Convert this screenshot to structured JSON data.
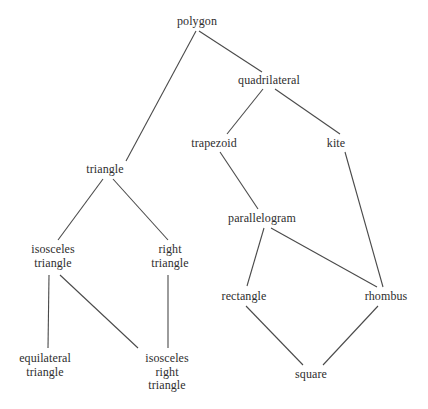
{
  "diagram": {
    "background_color": "#ffffff",
    "text_color": "#2e2e2e",
    "edge_color": "#4a4a4a",
    "nodes": [
      {
        "id": "polygon",
        "label": "polygon",
        "x": 197,
        "y": 22,
        "lines": 1
      },
      {
        "id": "quadrilateral",
        "label": "quadrilateral",
        "x": 269,
        "y": 81,
        "lines": 1
      },
      {
        "id": "trapezoid",
        "label": "trapezoid",
        "x": 214,
        "y": 144,
        "lines": 1
      },
      {
        "id": "kite",
        "label": "kite",
        "x": 336,
        "y": 144,
        "lines": 1
      },
      {
        "id": "triangle",
        "label": "triangle",
        "x": 105,
        "y": 170,
        "lines": 1
      },
      {
        "id": "parallelogram",
        "label": "parallelogram",
        "x": 262,
        "y": 219,
        "lines": 1
      },
      {
        "id": "isosceles-triangle",
        "label": "isosceles\ntriangle",
        "x": 53,
        "y": 256,
        "lines": 2
      },
      {
        "id": "right-triangle",
        "label": "right\ntriangle",
        "x": 170,
        "y": 256,
        "lines": 2
      },
      {
        "id": "rectangle",
        "label": "rectangle",
        "x": 244,
        "y": 297,
        "lines": 1
      },
      {
        "id": "rhombus",
        "label": "rhombus",
        "x": 386,
        "y": 297,
        "lines": 1
      },
      {
        "id": "equilateral-triangle",
        "label": "equilateral\ntriangle",
        "x": 45,
        "y": 365,
        "lines": 2
      },
      {
        "id": "isosceles-right-triangle",
        "label": "isosceles\nright\ntriangle",
        "x": 167,
        "y": 372,
        "lines": 3
      },
      {
        "id": "square",
        "label": "square",
        "x": 311,
        "y": 375,
        "lines": 1
      }
    ],
    "edges": [
      {
        "id": "polygon-triangle",
        "from": "polygon",
        "to": "triangle",
        "x1": 196,
        "y1": 31,
        "x2": 126,
        "y2": 161
      },
      {
        "id": "polygon-quadrilateral",
        "from": "polygon",
        "to": "quadrilateral",
        "x1": 199,
        "y1": 31,
        "x2": 262,
        "y2": 72
      },
      {
        "id": "quadrilateral-trapezoid",
        "from": "quadrilateral",
        "to": "trapezoid",
        "x1": 263,
        "y1": 89,
        "x2": 227,
        "y2": 134
      },
      {
        "id": "quadrilateral-kite",
        "from": "quadrilateral",
        "to": "kite",
        "x1": 275,
        "y1": 89,
        "x2": 340,
        "y2": 134
      },
      {
        "id": "trapezoid-parallelogram",
        "from": "trapezoid",
        "to": "parallelogram",
        "x1": 220,
        "y1": 152,
        "x2": 258,
        "y2": 209
      },
      {
        "id": "kite-rhombus",
        "from": "kite",
        "to": "rhombus",
        "x1": 345,
        "y1": 152,
        "x2": 383,
        "y2": 287
      },
      {
        "id": "triangle-isosceles-triangle",
        "from": "triangle",
        "to": "isosceles-triangle",
        "x1": 103,
        "y1": 179,
        "x2": 58,
        "y2": 240
      },
      {
        "id": "triangle-right-triangle",
        "from": "triangle",
        "to": "right-triangle",
        "x1": 113,
        "y1": 179,
        "x2": 168,
        "y2": 240
      },
      {
        "id": "parallelogram-rectangle",
        "from": "parallelogram",
        "to": "rectangle",
        "x1": 264,
        "y1": 228,
        "x2": 247,
        "y2": 286
      },
      {
        "id": "parallelogram-rhombus",
        "from": "parallelogram",
        "to": "rhombus",
        "x1": 271,
        "y1": 228,
        "x2": 377,
        "y2": 287
      },
      {
        "id": "isosceles-triangle-equilateral",
        "from": "isosceles-triangle",
        "to": "equilateral-triangle",
        "x1": 49,
        "y1": 275,
        "x2": 48,
        "y2": 348
      },
      {
        "id": "isosceles-triangle-isosceles-right",
        "from": "isosceles-triangle",
        "to": "isosceles-right-triangle",
        "x1": 60,
        "y1": 275,
        "x2": 138,
        "y2": 348
      },
      {
        "id": "right-triangle-isosceles-right",
        "from": "right-triangle",
        "to": "isosceles-right-triangle",
        "x1": 168,
        "y1": 275,
        "x2": 168,
        "y2": 348
      },
      {
        "id": "rectangle-square",
        "from": "rectangle",
        "to": "square",
        "x1": 246,
        "y1": 306,
        "x2": 303,
        "y2": 365
      },
      {
        "id": "rhombus-square",
        "from": "rhombus",
        "to": "square",
        "x1": 378,
        "y1": 306,
        "x2": 323,
        "y2": 365
      }
    ]
  }
}
